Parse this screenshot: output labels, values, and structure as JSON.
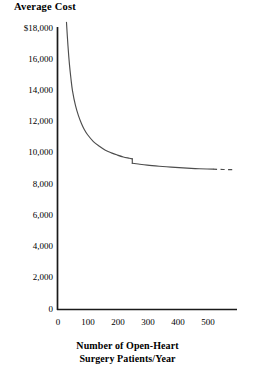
{
  "chart_data": {
    "type": "line",
    "title": "Average Cost",
    "ylabel": "Average Cost",
    "xlabel": "Number of Open-Heart Surgery Patients/Year",
    "xlabel_line1": "Number of Open-Heart",
    "xlabel_line2": "Surgery Patients/Year",
    "grid": false,
    "legend": "none",
    "xlim": [
      0,
      600
    ],
    "ylim": [
      0,
      18000
    ],
    "xticks": [
      0,
      100,
      200,
      300,
      400,
      500
    ],
    "xtick_labels": [
      "0",
      "100",
      "200",
      "300",
      "400",
      "500"
    ],
    "yticks": [
      0,
      2000,
      4000,
      6000,
      8000,
      10000,
      12000,
      14000,
      16000,
      18000
    ],
    "ytick_labels": [
      "0",
      "2,000",
      "4,000",
      "6,000",
      "8,000",
      "10,000",
      "12,000",
      "14,000",
      "16,000",
      "18,000"
    ],
    "ytick_label_top": "$18,000",
    "curve_color": "#4d4d4d",
    "axis_color": "#1a1a1a",
    "series": [
      {
        "name": "Average cost per open-heart surgery patient",
        "style": "solid",
        "points": [
          {
            "x": 30,
            "y": 18300
          },
          {
            "x": 35,
            "y": 16800
          },
          {
            "x": 40,
            "y": 15600
          },
          {
            "x": 45,
            "y": 14700
          },
          {
            "x": 50,
            "y": 13950
          },
          {
            "x": 60,
            "y": 13000
          },
          {
            "x": 70,
            "y": 12350
          },
          {
            "x": 80,
            "y": 11850
          },
          {
            "x": 90,
            "y": 11450
          },
          {
            "x": 100,
            "y": 11150
          },
          {
            "x": 120,
            "y": 10700
          },
          {
            "x": 140,
            "y": 10400
          },
          {
            "x": 160,
            "y": 10150
          },
          {
            "x": 180,
            "y": 9980
          },
          {
            "x": 200,
            "y": 9840
          },
          {
            "x": 220,
            "y": 9720
          },
          {
            "x": 240,
            "y": 9640
          },
          {
            "x": 250,
            "y": 9600
          }
        ]
      },
      {
        "name": "Average cost after capacity expansion",
        "style": "solid",
        "points": [
          {
            "x": 250,
            "y": 9320
          },
          {
            "x": 270,
            "y": 9270
          },
          {
            "x": 300,
            "y": 9200
          },
          {
            "x": 340,
            "y": 9130
          },
          {
            "x": 380,
            "y": 9070
          },
          {
            "x": 420,
            "y": 9020
          },
          {
            "x": 460,
            "y": 8980
          },
          {
            "x": 500,
            "y": 8950
          },
          {
            "x": 520,
            "y": 8940
          }
        ]
      },
      {
        "name": "Projected continuation",
        "style": "dashed",
        "points": [
          {
            "x": 520,
            "y": 8940
          },
          {
            "x": 545,
            "y": 8925
          },
          {
            "x": 570,
            "y": 8915
          },
          {
            "x": 590,
            "y": 8910
          }
        ]
      }
    ],
    "annotations": [
      {
        "type": "discontinuity",
        "at_x": 250,
        "from_y": 9600,
        "to_y": 9320,
        "note": "Downward jump in average cost near 250 patients/year"
      }
    ]
  }
}
